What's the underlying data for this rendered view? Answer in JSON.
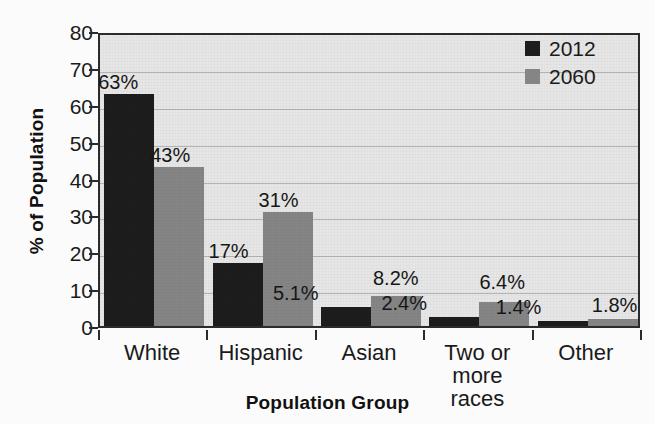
{
  "chart_data": {
    "type": "bar",
    "title": "",
    "xlabel": "Population Group",
    "ylabel": "% of Population",
    "ylim": [
      0,
      80
    ],
    "yticks": [
      0,
      10,
      20,
      30,
      40,
      50,
      60,
      70,
      80
    ],
    "grid": true,
    "legend_position": "top-right",
    "categories": [
      "White",
      "Hispanic",
      "Asian",
      "Two or more races",
      "Other"
    ],
    "category_lines": [
      [
        "White"
      ],
      [
        "Hispanic"
      ],
      [
        "Asian"
      ],
      [
        "Two or",
        "more races"
      ],
      [
        "Other"
      ]
    ],
    "series": [
      {
        "name": "2012",
        "color": "#1d1d1d",
        "values": [
          63,
          43,
          5.1,
          2.4,
          1.4
        ],
        "labels": [
          "63%",
          "43%",
          "5.1%",
          "2.4%",
          "1.4%"
        ]
      },
      {
        "name": "2060",
        "color": "#858585",
        "values": [
          43,
          31,
          8.2,
          6.4,
          1.8
        ],
        "labels": [
          "43%",
          "31%",
          "8.2%",
          "6.4%",
          "1.8%"
        ]
      }
    ],
    "note_series_mapping": "2012 = [63, 17, 5.1, 2.4, 1.4]; 2060 = [43, 31, 8.2, 6.4, 1.8]",
    "bars": [
      {
        "category": "White",
        "series": "2012",
        "value": 63,
        "label": "63%"
      },
      {
        "category": "White",
        "series": "2060",
        "value": 43,
        "label": "43%"
      },
      {
        "category": "Hispanic",
        "series": "2012",
        "value": 17,
        "label": "17%"
      },
      {
        "category": "Hispanic",
        "series": "2060",
        "value": 31,
        "label": "31%"
      },
      {
        "category": "Asian",
        "series": "2012",
        "value": 5.1,
        "label": "5.1%"
      },
      {
        "category": "Asian",
        "series": "2060",
        "value": 8.2,
        "label": "8.2%"
      },
      {
        "category": "Two or more races",
        "series": "2012",
        "value": 2.4,
        "label": "2.4%"
      },
      {
        "category": "Two or more races",
        "series": "2060",
        "value": 6.4,
        "label": "6.4%"
      },
      {
        "category": "Other",
        "series": "2012",
        "value": 1.4,
        "label": "1.4%"
      },
      {
        "category": "Other",
        "series": "2060",
        "value": 1.8,
        "label": "1.8%"
      }
    ]
  },
  "axes": {
    "y_title": "% of Population",
    "x_title": "Population Group",
    "y_tick_labels": [
      "80",
      "70",
      "60",
      "50",
      "40",
      "30",
      "20",
      "10",
      "0"
    ]
  },
  "legend": {
    "entries": [
      {
        "label": "2012",
        "color": "#1d1d1d"
      },
      {
        "label": "2060",
        "color": "#858585"
      }
    ]
  },
  "colors": {
    "series_2012": "#1d1d1d",
    "series_2060": "#858585",
    "plot_background": "#e6e6e6",
    "page_background": "#fbfbfb",
    "axis": "#2b2b2b",
    "gridline": "#b4b4b4",
    "text": "#1a1a1a"
  },
  "value_labels": {
    "white_2012": "63%",
    "white_2060": "43%",
    "hispanic_2012": "17%",
    "hispanic_2060": "31%",
    "asian_2012": "5.1%",
    "asian_2060": "8.2%",
    "two_2012": "2.4%",
    "two_2060": "6.4%",
    "other_2012": "1.4%",
    "other_2060": "1.8%"
  },
  "x_categories": {
    "c0": "White",
    "c1": "Hispanic",
    "c2": "Asian",
    "c3a": "Two or",
    "c3b": "more races",
    "c4": "Other"
  },
  "title_sliver": ""
}
